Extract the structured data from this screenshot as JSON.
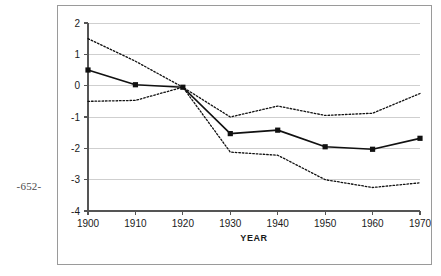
{
  "folio": {
    "page_number": "-652-"
  },
  "figure": {
    "axis_color": "#555555",
    "grid_color": "#cfcfcf",
    "frame_color": "#9a9a9a",
    "series_color": "#111111"
  },
  "chart_data": {
    "type": "line",
    "title": "",
    "subtitle": "",
    "xlabel": "YEAR",
    "ylabel": "",
    "x": [
      1900,
      1910,
      1920,
      1930,
      1940,
      1950,
      1960,
      1970
    ],
    "xtick_labels": [
      "1900",
      "1910",
      "1920",
      "1930",
      "1940",
      "1950",
      "1960",
      "1970"
    ],
    "ytick_labels": [
      "2",
      "1",
      "0",
      "-1",
      "-2",
      "-3",
      "-4"
    ],
    "yticks": [
      2,
      1,
      0,
      -1,
      -2,
      -3,
      -4
    ],
    "xlim": [
      1900,
      1970
    ],
    "ylim": [
      -4,
      2
    ],
    "grid": "horizontal",
    "legend": "none",
    "series": [
      {
        "name": "upper-bound",
        "style": "dotted",
        "markers": false,
        "values": [
          1.5,
          0.78,
          -0.05,
          -1.0,
          -0.65,
          -0.95,
          -0.88,
          -0.25
        ]
      },
      {
        "name": "central-estimate",
        "style": "solid",
        "markers": true,
        "values": [
          0.5,
          0.03,
          -0.05,
          -1.53,
          -1.42,
          -1.95,
          -2.03,
          -1.68
        ]
      },
      {
        "name": "lower-bound",
        "style": "dotted",
        "markers": false,
        "values": [
          -0.5,
          -0.47,
          -0.05,
          -2.12,
          -2.22,
          -3.0,
          -3.25,
          -3.1
        ]
      }
    ]
  }
}
